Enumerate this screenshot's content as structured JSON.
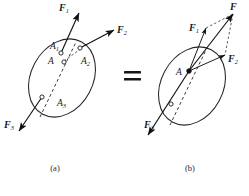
{
  "figure": {
    "equals_symbol": "=",
    "panels": [
      {
        "id": "a",
        "caption": "(a)",
        "description": "Rigid body with three concurrent forces applied at separate points",
        "forces": [
          {
            "name": "F1",
            "label": "F",
            "subscript": "1"
          },
          {
            "name": "F2",
            "label": "F",
            "subscript": "2"
          },
          {
            "name": "F3",
            "label": "F",
            "subscript": "3"
          }
        ],
        "points": [
          {
            "name": "A",
            "label": "A",
            "subscript": ""
          },
          {
            "name": "A1",
            "label": "A",
            "subscript": "1"
          },
          {
            "name": "A2",
            "label": "A",
            "subscript": "2"
          },
          {
            "name": "A3",
            "label": "A",
            "subscript": "3"
          }
        ]
      },
      {
        "id": "b",
        "caption": "(b)",
        "description": "Equivalent system with forces transmitted to common point A and resultant F",
        "forces": [
          {
            "name": "F",
            "label": "F",
            "subscript": ""
          },
          {
            "name": "F1",
            "label": "F",
            "subscript": "1"
          },
          {
            "name": "F2",
            "label": "F",
            "subscript": "2"
          },
          {
            "name": "F3",
            "label": "F",
            "subscript": "3"
          }
        ],
        "points": [
          {
            "name": "A",
            "label": "A",
            "subscript": ""
          }
        ]
      }
    ],
    "colors": {
      "ink": "#1a1a1a",
      "outline": "#262626",
      "background": "#ffffff"
    }
  }
}
